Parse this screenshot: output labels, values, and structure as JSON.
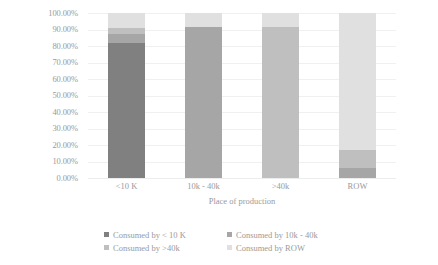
{
  "chart_data": {
    "type": "bar",
    "title": "",
    "xlabel": "Place of production",
    "ylabel": "",
    "categories": [
      "<10 K",
      "10k - 40k",
      ">40k",
      "ROW"
    ],
    "ylim": [
      0,
      100
    ],
    "ytick_labels": [
      "100.00%",
      "90.00%",
      "80.00%",
      "70.00%",
      "60.00%",
      "50.00%",
      "40.00%",
      "30.00%",
      "20.00%",
      "10.00%",
      "0.00%"
    ],
    "ytick_values": [
      100,
      90,
      80,
      70,
      60,
      50,
      40,
      30,
      20,
      10,
      0
    ],
    "grid": true,
    "stacked": true,
    "legend_position": "bottom",
    "series": [
      {
        "name": "Consumed by < 10 K",
        "color": "#808080",
        "values": [
          82.0,
          0.0,
          0.0,
          0.0
        ]
      },
      {
        "name": "Consumed by 10k - 40k",
        "color": "#a6a6a6",
        "values": [
          5.0,
          91.5,
          0.0,
          6.0
        ]
      },
      {
        "name": "Consumed by >40k",
        "color": "#bfbfbf",
        "values": [
          4.0,
          0.0,
          91.5,
          11.0
        ]
      },
      {
        "name": "Consumed by ROW",
        "color": "#e0e0e0",
        "values": [
          9.0,
          8.5,
          8.5,
          83.0
        ]
      }
    ]
  },
  "axis": {
    "x_title": "Place of production"
  }
}
